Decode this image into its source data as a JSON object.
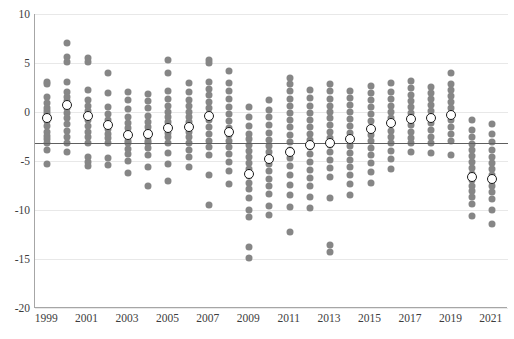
{
  "chart_data": {
    "type": "scatter",
    "title": "",
    "xlabel": "",
    "ylabel": "",
    "ylim": [
      -20,
      10
    ],
    "xlim": [
      1998.4,
      2021.8
    ],
    "grid": true,
    "legend": null,
    "y_ticks": [
      10,
      5,
      0,
      -5,
      -10,
      -15,
      -20
    ],
    "y_tick_labels": [
      "10",
      "5",
      "0",
      "-5",
      "-10",
      "-15",
      "-20"
    ],
    "x_ticks": [
      1999,
      2001,
      2003,
      2005,
      2007,
      2009,
      2011,
      2013,
      2015,
      2017,
      2019,
      2021
    ],
    "x_tick_labels": [
      "1999",
      "2001",
      "2003",
      "2005",
      "2007",
      "2009",
      "2011",
      "2013",
      "2015",
      "2017",
      "2019",
      "2021"
    ],
    "reference_line": {
      "value": -3.2,
      "orientation": "horizontal",
      "color": "#5f5f5f"
    },
    "dot_color": "#868686",
    "mean_marker": {
      "fill": "#ffffff",
      "stroke": "#1c1c1c",
      "shape": "circle"
    },
    "series": [
      {
        "name": "1999",
        "x": 1999,
        "mean": -0.6,
        "values": [
          3.1,
          2.9,
          1.5,
          0.9,
          0.4,
          0.1,
          -0.2,
          -0.5,
          -0.9,
          -1.4,
          -2.0,
          -2.4,
          -2.8,
          -3.2,
          -3.9,
          -5.3
        ]
      },
      {
        "name": "2000",
        "x": 2000,
        "mean": 0.7,
        "values": [
          7.0,
          5.6,
          5.1,
          3.1,
          2.0,
          1.5,
          1.1,
          0.8,
          0.4,
          -0.1,
          -0.6,
          -1.2,
          -1.9,
          -2.6,
          -3.2,
          -4.1
        ]
      },
      {
        "name": "2001",
        "x": 2001,
        "mean": -0.4,
        "values": [
          5.5,
          5.1,
          2.2,
          1.2,
          0.6,
          0.1,
          -0.3,
          -0.8,
          -1.4,
          -2.0,
          -2.6,
          -3.2,
          -4.6,
          -5.1,
          -5.5
        ]
      },
      {
        "name": "2002",
        "x": 2002,
        "mean": -1.3,
        "values": [
          4.0,
          1.9,
          0.5,
          -0.2,
          -0.8,
          -1.2,
          -1.7,
          -2.2,
          -2.7,
          -3.2,
          -4.7,
          -5.4
        ]
      },
      {
        "name": "2003",
        "x": 2003,
        "mean": -2.3,
        "values": [
          2.0,
          1.2,
          0.3,
          -0.5,
          -1.1,
          -1.6,
          -2.1,
          -2.5,
          -3.0,
          -3.2,
          -3.8,
          -4.3,
          -5.0,
          -6.2
        ]
      },
      {
        "name": "2004",
        "x": 2004,
        "mean": -2.2,
        "values": [
          1.8,
          1.1,
          0.4,
          -0.4,
          -1.0,
          -1.5,
          -2.0,
          -2.5,
          -3.0,
          -3.2,
          -3.7,
          -4.4,
          -5.6,
          -7.6
        ]
      },
      {
        "name": "2005",
        "x": 2005,
        "mean": -1.6,
        "values": [
          5.3,
          4.0,
          2.1,
          1.3,
          0.6,
          0.0,
          -0.5,
          -1.0,
          -1.5,
          -2.1,
          -2.6,
          -3.2,
          -4.2,
          -5.3,
          -7.0
        ]
      },
      {
        "name": "2006",
        "x": 2006,
        "mean": -1.5,
        "values": [
          3.0,
          2.0,
          1.2,
          0.6,
          0.0,
          -0.5,
          -1.0,
          -1.5,
          -2.0,
          -2.6,
          -3.2,
          -3.9,
          -4.6,
          -5.6
        ]
      },
      {
        "name": "2007",
        "x": 2007,
        "mean": -0.4,
        "values": [
          5.3,
          5.0,
          3.1,
          2.3,
          1.7,
          1.0,
          0.4,
          -0.2,
          -0.8,
          -1.5,
          -2.2,
          -3.0,
          -3.6,
          -4.4,
          -6.4,
          -9.5
        ]
      },
      {
        "name": "2008",
        "x": 2008,
        "mean": -2.0,
        "values": [
          4.2,
          3.0,
          2.1,
          1.3,
          0.5,
          -0.2,
          -0.9,
          -1.6,
          -2.3,
          -3.0,
          -3.6,
          -4.3,
          -5.1,
          -6.0,
          -7.3
        ]
      },
      {
        "name": "2009",
        "x": 2009,
        "mean": -6.3,
        "values": [
          0.5,
          -0.5,
          -1.4,
          -2.2,
          -2.8,
          -3.4,
          -4.0,
          -4.6,
          -5.2,
          -5.8,
          -6.5,
          -7.2,
          -7.9,
          -8.8,
          -10.0,
          -10.7,
          -13.8,
          -14.9
        ]
      },
      {
        "name": "2010",
        "x": 2010,
        "mean": -4.8,
        "values": [
          1.2,
          0.2,
          -0.5,
          -1.3,
          -2.1,
          -2.9,
          -3.5,
          -4.1,
          -4.7,
          -5.3,
          -6.0,
          -6.8,
          -7.5,
          -8.4,
          -9.6,
          -10.5
        ]
      },
      {
        "name": "2011",
        "x": 2011,
        "mean": -4.1,
        "values": [
          3.5,
          2.9,
          2.1,
          1.3,
          0.6,
          -0.1,
          -0.8,
          -1.5,
          -2.3,
          -3.1,
          -3.9,
          -4.7,
          -5.5,
          -6.4,
          -7.4,
          -8.5,
          -9.7,
          -12.2
        ]
      },
      {
        "name": "2012",
        "x": 2012,
        "mean": -3.4,
        "values": [
          2.2,
          1.4,
          0.6,
          -0.1,
          -0.8,
          -1.5,
          -2.2,
          -2.9,
          -3.6,
          -4.3,
          -5.1,
          -5.9,
          -6.7,
          -7.6,
          -8.7,
          -9.8
        ]
      },
      {
        "name": "2013",
        "x": 2013,
        "mean": -3.2,
        "values": [
          2.9,
          2.1,
          1.3,
          0.6,
          0.0,
          -0.6,
          -1.3,
          -2.0,
          -2.7,
          -3.4,
          -4.1,
          -4.9,
          -5.7,
          -6.6,
          -8.8,
          -13.6,
          -14.3
        ]
      },
      {
        "name": "2014",
        "x": 2014,
        "mean": -2.8,
        "values": [
          2.1,
          1.4,
          0.7,
          0.0,
          -0.7,
          -1.4,
          -2.1,
          -2.8,
          -3.5,
          -4.2,
          -4.9,
          -5.6,
          -6.4,
          -7.3,
          -8.5
        ]
      },
      {
        "name": "2015",
        "x": 2015,
        "mean": -1.7,
        "values": [
          2.7,
          1.9,
          1.2,
          0.5,
          -0.2,
          -0.9,
          -1.6,
          -2.3,
          -3.0,
          -3.7,
          -4.4,
          -5.2,
          -6.1,
          -7.2
        ]
      },
      {
        "name": "2016",
        "x": 2016,
        "mean": -1.1,
        "values": [
          3.0,
          2.0,
          1.3,
          0.6,
          0.0,
          -0.6,
          -1.2,
          -1.9,
          -2.6,
          -3.2,
          -4.0,
          -4.8,
          -5.8
        ]
      },
      {
        "name": "2017",
        "x": 2017,
        "mean": -0.7,
        "values": [
          3.2,
          2.4,
          1.7,
          1.1,
          0.5,
          -0.1,
          -0.7,
          -1.3,
          -2.0,
          -2.7,
          -3.2,
          -4.1
        ]
      },
      {
        "name": "2018",
        "x": 2018,
        "mean": -0.6,
        "values": [
          2.6,
          1.9,
          1.3,
          0.7,
          0.1,
          -0.5,
          -1.1,
          -1.8,
          -2.5,
          -3.2,
          -4.2
        ]
      },
      {
        "name": "2019",
        "x": 2019,
        "mean": -0.3,
        "values": [
          4.0,
          2.9,
          2.2,
          1.6,
          1.0,
          0.4,
          -0.2,
          -0.8,
          -1.5,
          -2.2,
          -3.0,
          -4.4
        ]
      },
      {
        "name": "2020",
        "x": 2020,
        "mean": -6.6,
        "values": [
          -0.8,
          -1.8,
          -2.6,
          -3.3,
          -3.9,
          -4.5,
          -5.1,
          -5.7,
          -6.3,
          -6.9,
          -7.5,
          -8.1,
          -8.7,
          -9.4,
          -10.6
        ]
      },
      {
        "name": "2021",
        "x": 2021,
        "mean": -6.8,
        "values": [
          -1.2,
          -2.2,
          -3.1,
          -3.9,
          -4.6,
          -5.2,
          -5.8,
          -6.4,
          -7.0,
          -7.6,
          -8.2,
          -8.9,
          -10.0,
          -11.4
        ]
      }
    ]
  }
}
